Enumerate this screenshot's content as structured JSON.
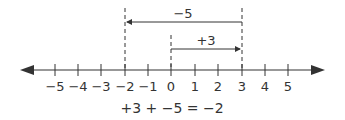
{
  "diagram": {
    "type": "number-line",
    "ticks": [
      "−5",
      "−4",
      "−3",
      "−2",
      "−1",
      "0",
      "1",
      "2",
      "3",
      "4",
      "5"
    ],
    "arrow_top": {
      "label": "−5",
      "from": 3,
      "to": -2
    },
    "arrow_mid": {
      "label": "+3",
      "from": 0,
      "to": 3
    },
    "equation": "+3 + −5 = −2",
    "color": "#333333"
  }
}
